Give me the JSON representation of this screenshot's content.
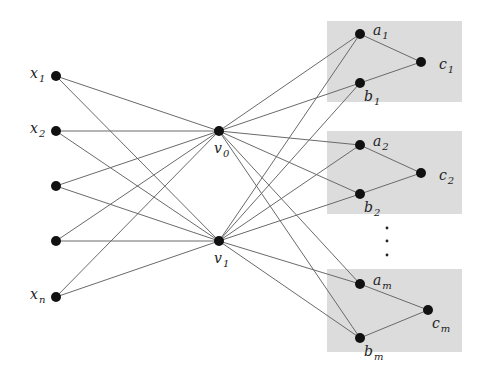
{
  "title": "",
  "colors": {
    "box_fill": "#dcdcdc",
    "edge": "#6a6a6a",
    "node": "#111111",
    "label": "#222222"
  },
  "nodes": {
    "x1": {
      "x": 56,
      "y": 76,
      "label": "x",
      "sub": "1",
      "label_pos": "left"
    },
    "x2": {
      "x": 56,
      "y": 131,
      "label": "x",
      "sub": "2",
      "label_pos": "left"
    },
    "x3": {
      "x": 56,
      "y": 186,
      "label": "",
      "sub": "",
      "label_pos": "left"
    },
    "x4": {
      "x": 56,
      "y": 241,
      "label": "",
      "sub": "",
      "label_pos": "left"
    },
    "xn": {
      "x": 56,
      "y": 297,
      "label": "x",
      "sub": "n",
      "label_pos": "left"
    },
    "v0": {
      "x": 219,
      "y": 131,
      "label": "v",
      "sub": "0",
      "label_pos": "below"
    },
    "v1": {
      "x": 219,
      "y": 241,
      "label": "v",
      "sub": "1",
      "label_pos": "below"
    },
    "a1": {
      "x": 360,
      "y": 34,
      "label": "a",
      "sub": "1",
      "label_pos": "right-up"
    },
    "b1": {
      "x": 360,
      "y": 83,
      "label": "b",
      "sub": "1",
      "label_pos": "right-down"
    },
    "c1": {
      "x": 421,
      "y": 62,
      "label": "c",
      "sub": "1",
      "label_pos": "right"
    },
    "a2": {
      "x": 360,
      "y": 145,
      "label": "a",
      "sub": "2",
      "label_pos": "right-up"
    },
    "b2": {
      "x": 360,
      "y": 194,
      "label": "b",
      "sub": "2",
      "label_pos": "right-down"
    },
    "c2": {
      "x": 421,
      "y": 173,
      "label": "c",
      "sub": "2",
      "label_pos": "right"
    },
    "am": {
      "x": 360,
      "y": 284,
      "label": "a",
      "sub": "m",
      "label_pos": "right-up"
    },
    "bm": {
      "x": 360,
      "y": 338,
      "label": "b",
      "sub": "m",
      "label_pos": "right-down"
    },
    "cm": {
      "x": 428,
      "y": 310,
      "label": "c",
      "sub": "m",
      "label_pos": "right-down"
    }
  },
  "edges": [
    [
      "x1",
      "v0"
    ],
    [
      "x1",
      "v1"
    ],
    [
      "x2",
      "v0"
    ],
    [
      "x2",
      "v1"
    ],
    [
      "x3",
      "v0"
    ],
    [
      "x3",
      "v1"
    ],
    [
      "x4",
      "v0"
    ],
    [
      "x4",
      "v1"
    ],
    [
      "xn",
      "v0"
    ],
    [
      "xn",
      "v1"
    ],
    [
      "v0",
      "a1"
    ],
    [
      "v0",
      "b1"
    ],
    [
      "v0",
      "a2"
    ],
    [
      "v0",
      "b2"
    ],
    [
      "v0",
      "am"
    ],
    [
      "v0",
      "bm"
    ],
    [
      "v1",
      "a1"
    ],
    [
      "v1",
      "b1"
    ],
    [
      "v1",
      "a2"
    ],
    [
      "v1",
      "b2"
    ],
    [
      "v1",
      "am"
    ],
    [
      "v1",
      "bm"
    ],
    [
      "a1",
      "c1"
    ],
    [
      "b1",
      "c1"
    ],
    [
      "a2",
      "c2"
    ],
    [
      "b2",
      "c2"
    ],
    [
      "am",
      "cm"
    ],
    [
      "bm",
      "cm"
    ]
  ],
  "boxes": [
    {
      "name": "gadget-1",
      "x": 327,
      "y": 21,
      "w": 135,
      "h": 81
    },
    {
      "name": "gadget-2",
      "x": 327,
      "y": 131,
      "w": 135,
      "h": 83
    },
    {
      "name": "gadget-m",
      "x": 327,
      "y": 269,
      "w": 135,
      "h": 83
    }
  ],
  "ellipsis_dots": [
    {
      "x": 387,
      "y": 228
    },
    {
      "x": 387,
      "y": 241
    },
    {
      "x": 387,
      "y": 255
    }
  ]
}
